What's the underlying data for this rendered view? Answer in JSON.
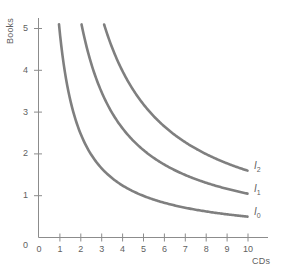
{
  "chart_data": {
    "type": "line",
    "title": "",
    "xlabel": "CDs",
    "ylabel": "Books",
    "xlim": [
      0,
      10.8
    ],
    "ylim": [
      0,
      5.4
    ],
    "xticks": [
      "0",
      "1",
      "2",
      "3",
      "4",
      "5",
      "6",
      "7",
      "8",
      "9",
      "10"
    ],
    "yticks": [
      "0",
      "1",
      "2",
      "3",
      "4",
      "5"
    ],
    "grid": false,
    "legend_position": "inline-right-of-curve",
    "line_color": "#7f7f7f",
    "axis_color": "#8c8c8c",
    "text_color": "#5f5f5f",
    "background": "#ffffff",
    "series": [
      {
        "name": "I0",
        "label": "I",
        "subscript": "0",
        "constant_k": 5.0,
        "x": [
          0.98,
          1.2,
          1.5,
          2.0,
          2.5,
          3.0,
          3.5,
          4.0,
          4.5,
          5.0,
          5.5,
          6.0,
          6.5,
          7.0,
          7.5,
          8.0,
          8.5,
          9.0,
          9.5,
          10.0
        ],
        "y": [
          5.1,
          4.17,
          3.33,
          2.5,
          2.0,
          1.67,
          1.43,
          1.25,
          1.11,
          1.0,
          0.91,
          0.83,
          0.77,
          0.71,
          0.67,
          0.63,
          0.59,
          0.56,
          0.53,
          0.5
        ]
      },
      {
        "name": "I1",
        "label": "I",
        "subscript": "1",
        "constant_k": 10.5,
        "x": [
          2.06,
          2.25,
          2.5,
          3.0,
          3.5,
          4.0,
          4.5,
          5.0,
          5.5,
          6.0,
          6.5,
          7.0,
          7.5,
          8.0,
          8.5,
          9.0,
          9.5,
          10.0
        ],
        "y": [
          5.1,
          4.67,
          4.2,
          3.5,
          3.0,
          2.63,
          2.33,
          2.1,
          1.91,
          1.75,
          1.62,
          1.5,
          1.4,
          1.31,
          1.24,
          1.17,
          1.11,
          1.05
        ]
      },
      {
        "name": "I2",
        "label": "I",
        "subscript": "2",
        "constant_k": 16.0,
        "x": [
          3.14,
          3.5,
          4.0,
          4.5,
          5.0,
          5.5,
          6.0,
          6.5,
          7.0,
          7.5,
          8.0,
          8.5,
          9.0,
          9.5,
          10.0
        ],
        "y": [
          5.1,
          4.57,
          4.0,
          3.56,
          3.2,
          2.91,
          2.67,
          2.46,
          2.29,
          2.13,
          2.0,
          1.88,
          1.78,
          1.68,
          1.6
        ]
      }
    ],
    "annotations": [
      {
        "name": "I2",
        "text_label": "I",
        "text_subscript": "2",
        "at_x": 10,
        "at_y": 1.6
      },
      {
        "name": "I1",
        "text_label": "I",
        "text_subscript": "1",
        "at_x": 10,
        "at_y": 1.05
      },
      {
        "name": "I0",
        "text_label": "I",
        "text_subscript": "0",
        "at_x": 10,
        "at_y": 0.5
      }
    ]
  },
  "axes": {
    "y_title": "Books",
    "x_title": "CDs",
    "y_tick_labels": [
      "5",
      "4",
      "3",
      "2",
      "1",
      "0"
    ],
    "x_tick_labels": [
      "0",
      "1",
      "2",
      "3",
      "4",
      "5",
      "6",
      "7",
      "8",
      "9",
      "10"
    ]
  },
  "curve_labels": {
    "i2": {
      "base": "I",
      "sub": "2"
    },
    "i1": {
      "base": "I",
      "sub": "1"
    },
    "i0": {
      "base": "I",
      "sub": "0"
    }
  }
}
